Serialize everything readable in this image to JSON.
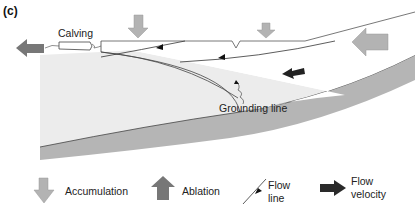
{
  "panel_label": "(c)",
  "diagram": {
    "labels": {
      "calving": "Calving",
      "grounding_line": "Grounding line"
    },
    "colors": {
      "ocean": "#ececec",
      "bed": "#b5b5b5",
      "ice": "#ffffff",
      "accumulation_arrow": "#b3b3b3",
      "ablation_arrow": "#777777",
      "flow_velocity_arrow": "#2a2a2a",
      "line": "#444444"
    }
  },
  "legend": {
    "items": [
      {
        "icon": "accumulation-arrow-icon",
        "label": "Accumulation"
      },
      {
        "icon": "ablation-arrow-icon",
        "label": "Ablation"
      },
      {
        "icon": "flow-line-icon",
        "label_line1": "Flow",
        "label_line2": "line"
      },
      {
        "icon": "flow-velocity-arrow-icon",
        "label_line1": "Flow",
        "label_line2": "velocity"
      }
    ]
  }
}
